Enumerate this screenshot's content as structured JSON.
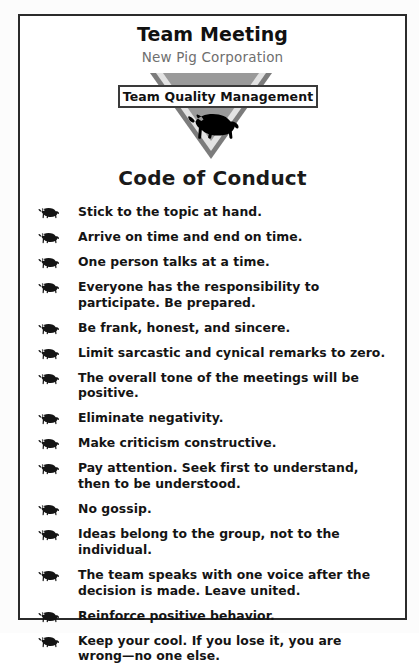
{
  "poster": {
    "title": "Team Meeting",
    "subtitle": "New Pig Corporation",
    "banner_label": "Team Quality Management",
    "section_heading": "Code of Conduct",
    "logo_icon": "pig-silhouette-icon",
    "bullet_icon": "pig-silhouette-bullet-icon",
    "colors": {
      "page_background": "#fcfcfc",
      "card_background": "#ffffff",
      "card_border": "#2b2b2b",
      "title_text": "#111111",
      "subtitle_text": "#6f6f6f",
      "triangle_outer": "#7c7c7c",
      "triangle_band": "#e3e3e3",
      "triangle_inner": "#9a9a9a",
      "pig_silhouette": "#000000",
      "banner_border": "#3a3a3a",
      "body_text": "#141414"
    }
  },
  "rules": [
    {
      "text": "Stick to the topic at hand."
    },
    {
      "text": "Arrive on time and end on time."
    },
    {
      "text": "One person talks at a time."
    },
    {
      "text": "Everyone has the responsibility to participate. Be prepared."
    },
    {
      "text": "Be frank, honest, and sincere."
    },
    {
      "text": "Limit sarcastic and cynical remarks to zero."
    },
    {
      "text": "The overall tone of the meetings will be positive."
    },
    {
      "text": "Eliminate negativity."
    },
    {
      "text": "Make criticism constructive."
    },
    {
      "text": "Pay attention. Seek first to understand, then to be understood."
    },
    {
      "text": "No gossip."
    },
    {
      "text": "Ideas belong to the group, not to the individual."
    },
    {
      "text": "The team speaks with one voice after the decision is made. Leave united."
    },
    {
      "text": "Reinforce positive behavior."
    },
    {
      "text": "Keep your cool. If you lose it, you are wrong—no one else."
    }
  ]
}
